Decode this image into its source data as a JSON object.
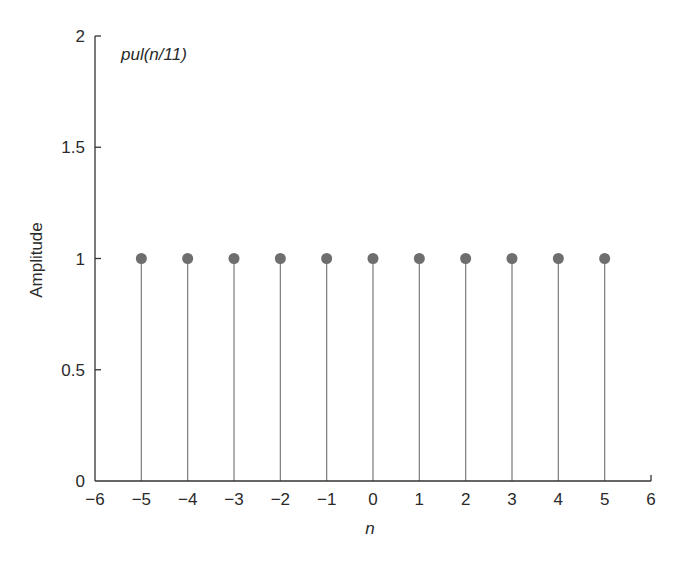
{
  "chart_data": {
    "type": "stem",
    "title": "pul(n/11)",
    "xlabel": "n",
    "ylabel": "Amplitude",
    "xlim": [
      -6,
      6
    ],
    "ylim": [
      0,
      2
    ],
    "x": [
      -5,
      -4,
      -3,
      -2,
      -1,
      0,
      1,
      2,
      3,
      4,
      5
    ],
    "values": [
      1,
      1,
      1,
      1,
      1,
      1,
      1,
      1,
      1,
      1,
      1
    ],
    "xticks": [
      "-6",
      "-5",
      "-4",
      "-3",
      "-2",
      "-1",
      "0",
      "1",
      "2",
      "3",
      "4",
      "5",
      "6"
    ],
    "yticks": [
      "0",
      "0.5",
      "1",
      "1.5",
      "2"
    ],
    "grid": false,
    "marker_color": "#6e6e6e",
    "stem_color": "#7a7a7a",
    "axis_color": "#333333"
  },
  "labels": {
    "annotation": "pul(n/11)",
    "xlabel": "n",
    "ylabel": "Amplitude",
    "xticks": [
      "−6",
      "−5",
      "−4",
      "−3",
      "−2",
      "−1",
      "0",
      "1",
      "2",
      "3",
      "4",
      "5",
      "6"
    ],
    "yticks": [
      "0",
      "0.5",
      "1",
      "1.5",
      "2"
    ]
  }
}
